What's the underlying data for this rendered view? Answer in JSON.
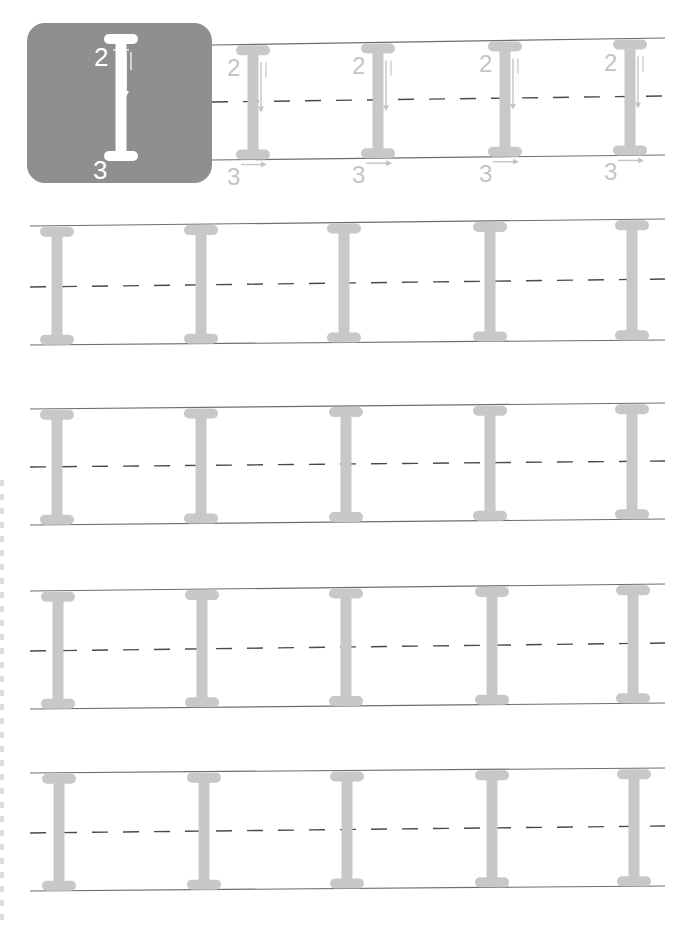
{
  "worksheet": {
    "letter": "I",
    "example_box": {
      "x": 27,
      "y": 23,
      "width": 185,
      "height": 160,
      "radius": 18,
      "fill": "#8f8f8f",
      "glyph_color": "#ffffff",
      "stroke_number_top": "2",
      "stroke_number_bottom": "3"
    },
    "guide_row_first": {
      "x_start": 212,
      "x_end": 665,
      "top": [
        45,
        38
      ],
      "mid": [
        102,
        96
      ],
      "bottom": [
        160,
        155
      ],
      "letter_x": [
        253,
        378,
        505,
        630
      ],
      "stroke_number_top": "2",
      "stroke_number_bottom": "3"
    },
    "practice_rows": [
      {
        "x_start": 30,
        "x_end": 665,
        "top": [
          226,
          219
        ],
        "mid": [
          287,
          279
        ],
        "bottom": [
          345,
          340
        ],
        "letter_x": [
          57,
          201,
          344,
          490,
          632
        ]
      },
      {
        "x_start": 30,
        "x_end": 665,
        "top": [
          409,
          403
        ],
        "mid": [
          467,
          461
        ],
        "bottom": [
          525,
          519
        ],
        "letter_x": [
          57,
          201,
          346,
          490,
          632
        ]
      },
      {
        "x_start": 30,
        "x_end": 665,
        "top": [
          591,
          584
        ],
        "mid": [
          651,
          643
        ],
        "bottom": [
          709,
          703
        ],
        "letter_x": [
          58,
          202,
          346,
          492,
          633
        ]
      },
      {
        "x_start": 30,
        "x_end": 665,
        "top": [
          773,
          768
        ],
        "mid": [
          833,
          826
        ],
        "bottom": [
          891,
          886
        ],
        "letter_x": [
          59,
          204,
          347,
          492,
          634
        ]
      }
    ],
    "colors": {
      "line": "#6e6e6e",
      "dash": "#4a4a4a",
      "trace_letter": "#c8c8c8",
      "hint_text": "#c4c4c4"
    }
  }
}
